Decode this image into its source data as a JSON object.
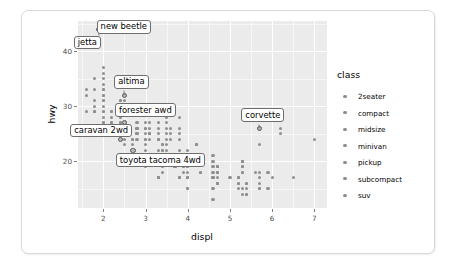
{
  "chart_data": {
    "type": "scatter",
    "title": "",
    "xlabel": "displ",
    "ylabel": "hwy",
    "xlim": [
      1.4,
      7.3
    ],
    "ylim": [
      11.5,
      45.5
    ],
    "xticks": [
      "2",
      "3",
      "4",
      "5",
      "6",
      "7"
    ],
    "xtick_values": [
      2,
      3,
      4,
      5,
      6,
      7
    ],
    "yticks": [
      "20",
      "30",
      "40"
    ],
    "ytick_values": [
      20,
      30,
      40
    ],
    "grid": true,
    "legend": {
      "title": "class",
      "position": "right",
      "entries": [
        {
          "label": "2seater",
          "color": "#8e8e8e"
        },
        {
          "label": "compact",
          "color": "#8e8e8e"
        },
        {
          "label": "midsize",
          "color": "#8e8e8e"
        },
        {
          "label": "minivan",
          "color": "#8e8e8e"
        },
        {
          "label": "pickup",
          "color": "#8e8e8e"
        },
        {
          "label": "subcompact",
          "color": "#8e8e8e"
        },
        {
          "label": "suv",
          "color": "#8e8e8e"
        }
      ]
    },
    "annotations": [
      {
        "text": "new beetle",
        "x": 2.0,
        "y": 44.0,
        "label_x": 2.48,
        "label_y": 44.3
      },
      {
        "text": "jetta",
        "x": 1.9,
        "y": 44.0,
        "label_x": 1.62,
        "label_y": 41.4
      },
      {
        "text": "altima",
        "x": 2.5,
        "y": 32.0,
        "label_x": 2.66,
        "label_y": 34.3
      },
      {
        "text": "forester awd",
        "x": 2.5,
        "y": 27.0,
        "label_x": 3.0,
        "label_y": 29.1
      },
      {
        "text": "caravan 2wd",
        "x": 2.4,
        "y": 24.0,
        "label_x": 1.95,
        "label_y": 25.4
      },
      {
        "text": "toyota tacoma 4wd",
        "x": 2.7,
        "y": 22.0,
        "label_x": 3.35,
        "label_y": 20.0
      },
      {
        "text": "corvette",
        "x": 5.7,
        "y": 26.0,
        "label_x": 5.78,
        "label_y": 28.2
      }
    ],
    "points": [
      {
        "x": 1.8,
        "y": 29
      },
      {
        "x": 1.8,
        "y": 29
      },
      {
        "x": 2.0,
        "y": 31
      },
      {
        "x": 2.0,
        "y": 30
      },
      {
        "x": 2.8,
        "y": 26
      },
      {
        "x": 2.8,
        "y": 26
      },
      {
        "x": 3.1,
        "y": 27
      },
      {
        "x": 1.8,
        "y": 26
      },
      {
        "x": 1.8,
        "y": 25
      },
      {
        "x": 2.0,
        "y": 28
      },
      {
        "x": 2.0,
        "y": 27
      },
      {
        "x": 2.8,
        "y": 25
      },
      {
        "x": 2.8,
        "y": 25
      },
      {
        "x": 3.1,
        "y": 25
      },
      {
        "x": 3.1,
        "y": 25
      },
      {
        "x": 2.8,
        "y": 24
      },
      {
        "x": 3.1,
        "y": 25
      },
      {
        "x": 4.2,
        "y": 23
      },
      {
        "x": 5.3,
        "y": 20
      },
      {
        "x": 5.3,
        "y": 15
      },
      {
        "x": 5.3,
        "y": 20
      },
      {
        "x": 5.7,
        "y": 17
      },
      {
        "x": 6.0,
        "y": 17
      },
      {
        "x": 5.7,
        "y": 26
      },
      {
        "x": 5.7,
        "y": 23
      },
      {
        "x": 6.2,
        "y": 26
      },
      {
        "x": 6.2,
        "y": 25
      },
      {
        "x": 7.0,
        "y": 24
      },
      {
        "x": 5.3,
        "y": 19
      },
      {
        "x": 5.3,
        "y": 14
      },
      {
        "x": 5.7,
        "y": 15
      },
      {
        "x": 6.5,
        "y": 17
      },
      {
        "x": 2.4,
        "y": 27
      },
      {
        "x": 2.4,
        "y": 30
      },
      {
        "x": 3.1,
        "y": 26
      },
      {
        "x": 3.5,
        "y": 29
      },
      {
        "x": 3.6,
        "y": 26
      },
      {
        "x": 2.4,
        "y": 24
      },
      {
        "x": 3.0,
        "y": 24
      },
      {
        "x": 3.3,
        "y": 17
      },
      {
        "x": 3.3,
        "y": 17
      },
      {
        "x": 3.3,
        "y": 17
      },
      {
        "x": 3.3,
        "y": 17
      },
      {
        "x": 3.3,
        "y": 17
      },
      {
        "x": 3.8,
        "y": 17
      },
      {
        "x": 3.8,
        "y": 17
      },
      {
        "x": 3.8,
        "y": 17
      },
      {
        "x": 4.0,
        "y": 17
      },
      {
        "x": 3.7,
        "y": 19
      },
      {
        "x": 3.7,
        "y": 19
      },
      {
        "x": 3.9,
        "y": 19
      },
      {
        "x": 3.9,
        "y": 19
      },
      {
        "x": 4.7,
        "y": 19
      },
      {
        "x": 4.7,
        "y": 19
      },
      {
        "x": 4.7,
        "y": 19
      },
      {
        "x": 5.2,
        "y": 17
      },
      {
        "x": 5.2,
        "y": 17
      },
      {
        "x": 3.9,
        "y": 18
      },
      {
        "x": 4.7,
        "y": 18
      },
      {
        "x": 4.7,
        "y": 18
      },
      {
        "x": 4.7,
        "y": 18
      },
      {
        "x": 5.2,
        "y": 17
      },
      {
        "x": 5.7,
        "y": 18
      },
      {
        "x": 5.9,
        "y": 18
      },
      {
        "x": 4.7,
        "y": 16
      },
      {
        "x": 4.7,
        "y": 16
      },
      {
        "x": 4.7,
        "y": 16
      },
      {
        "x": 5.2,
        "y": 16
      },
      {
        "x": 5.7,
        "y": 16
      },
      {
        "x": 5.9,
        "y": 15
      },
      {
        "x": 4.6,
        "y": 15
      },
      {
        "x": 5.4,
        "y": 14
      },
      {
        "x": 5.4,
        "y": 14
      },
      {
        "x": 4.0,
        "y": 15
      },
      {
        "x": 4.0,
        "y": 15
      },
      {
        "x": 4.6,
        "y": 13
      },
      {
        "x": 5.0,
        "y": 17
      },
      {
        "x": 4.2,
        "y": 23
      },
      {
        "x": 4.2,
        "y": 23
      },
      {
        "x": 4.6,
        "y": 19
      },
      {
        "x": 4.6,
        "y": 18
      },
      {
        "x": 4.6,
        "y": 17
      },
      {
        "x": 4.6,
        "y": 17
      },
      {
        "x": 5.4,
        "y": 16
      },
      {
        "x": 5.4,
        "y": 16
      },
      {
        "x": 5.4,
        "y": 15
      },
      {
        "x": 4.0,
        "y": 19
      },
      {
        "x": 4.0,
        "y": 19
      },
      {
        "x": 4.6,
        "y": 21
      },
      {
        "x": 4.6,
        "y": 20
      },
      {
        "x": 2.4,
        "y": 31
      },
      {
        "x": 2.4,
        "y": 31
      },
      {
        "x": 2.5,
        "y": 31
      },
      {
        "x": 3.3,
        "y": 27
      },
      {
        "x": 2.0,
        "y": 33
      },
      {
        "x": 2.0,
        "y": 35
      },
      {
        "x": 2.0,
        "y": 32
      },
      {
        "x": 2.0,
        "y": 36
      },
      {
        "x": 2.0,
        "y": 37
      },
      {
        "x": 2.0,
        "y": 34
      },
      {
        "x": 1.8,
        "y": 33
      },
      {
        "x": 1.6,
        "y": 33
      },
      {
        "x": 1.6,
        "y": 32
      },
      {
        "x": 1.6,
        "y": 29
      },
      {
        "x": 1.8,
        "y": 29
      },
      {
        "x": 2.0,
        "y": 29
      },
      {
        "x": 2.0,
        "y": 31
      },
      {
        "x": 2.5,
        "y": 29
      },
      {
        "x": 2.5,
        "y": 27
      },
      {
        "x": 2.5,
        "y": 26
      },
      {
        "x": 2.5,
        "y": 26
      },
      {
        "x": 2.5,
        "y": 25
      },
      {
        "x": 2.2,
        "y": 29
      },
      {
        "x": 2.2,
        "y": 29
      },
      {
        "x": 2.2,
        "y": 28
      },
      {
        "x": 2.2,
        "y": 27
      },
      {
        "x": 2.2,
        "y": 26
      },
      {
        "x": 2.4,
        "y": 26
      },
      {
        "x": 2.4,
        "y": 26
      },
      {
        "x": 2.4,
        "y": 25
      },
      {
        "x": 2.4,
        "y": 25
      },
      {
        "x": 2.4,
        "y": 24
      },
      {
        "x": 3.0,
        "y": 26
      },
      {
        "x": 3.0,
        "y": 25
      },
      {
        "x": 3.0,
        "y": 24
      },
      {
        "x": 3.3,
        "y": 26
      },
      {
        "x": 3.3,
        "y": 25
      },
      {
        "x": 3.3,
        "y": 24
      },
      {
        "x": 3.5,
        "y": 26
      },
      {
        "x": 3.5,
        "y": 25
      },
      {
        "x": 3.5,
        "y": 24
      },
      {
        "x": 3.8,
        "y": 26
      },
      {
        "x": 3.8,
        "y": 25
      },
      {
        "x": 3.8,
        "y": 24
      },
      {
        "x": 3.8,
        "y": 28
      },
      {
        "x": 2.7,
        "y": 23
      },
      {
        "x": 2.7,
        "y": 22
      },
      {
        "x": 3.0,
        "y": 22
      },
      {
        "x": 3.4,
        "y": 22
      },
      {
        "x": 3.4,
        "y": 22
      },
      {
        "x": 4.0,
        "y": 20
      },
      {
        "x": 4.0,
        "y": 20
      },
      {
        "x": 4.0,
        "y": 18
      },
      {
        "x": 4.3,
        "y": 18
      },
      {
        "x": 4.3,
        "y": 18
      },
      {
        "x": 3.0,
        "y": 19
      },
      {
        "x": 3.4,
        "y": 19
      },
      {
        "x": 3.4,
        "y": 18
      },
      {
        "x": 4.0,
        "y": 17
      },
      {
        "x": 4.0,
        "y": 17
      },
      {
        "x": 2.7,
        "y": 24
      },
      {
        "x": 2.7,
        "y": 24
      },
      {
        "x": 3.0,
        "y": 23
      },
      {
        "x": 3.4,
        "y": 23
      },
      {
        "x": 3.4,
        "y": 23
      },
      {
        "x": 4.7,
        "y": 17
      },
      {
        "x": 4.7,
        "y": 16
      },
      {
        "x": 5.2,
        "y": 15
      },
      {
        "x": 5.7,
        "y": 15
      },
      {
        "x": 5.2,
        "y": 16
      },
      {
        "x": 2.5,
        "y": 24
      },
      {
        "x": 2.5,
        "y": 23
      },
      {
        "x": 3.5,
        "y": 23
      },
      {
        "x": 3.5,
        "y": 22
      },
      {
        "x": 3.3,
        "y": 22
      },
      {
        "x": 3.3,
        "y": 21
      },
      {
        "x": 2.2,
        "y": 27
      },
      {
        "x": 2.2,
        "y": 26
      },
      {
        "x": 2.4,
        "y": 28
      },
      {
        "x": 2.4,
        "y": 27
      },
      {
        "x": 3.0,
        "y": 27
      },
      {
        "x": 3.0,
        "y": 26
      },
      {
        "x": 3.5,
        "y": 28
      },
      {
        "x": 3.5,
        "y": 27
      },
      {
        "x": 1.8,
        "y": 35
      },
      {
        "x": 1.8,
        "y": 31
      },
      {
        "x": 1.8,
        "y": 30
      },
      {
        "x": 2.0,
        "y": 33
      },
      {
        "x": 2.0,
        "y": 32
      },
      {
        "x": 2.8,
        "y": 27
      },
      {
        "x": 2.8,
        "y": 26
      },
      {
        "x": 3.6,
        "y": 25
      },
      {
        "x": 3.6,
        "y": 24
      },
      {
        "x": 2.0,
        "y": 29
      },
      {
        "x": 2.0,
        "y": 27
      },
      {
        "x": 3.3,
        "y": 24
      },
      {
        "x": 3.3,
        "y": 24
      },
      {
        "x": 4.0,
        "y": 22
      },
      {
        "x": 5.6,
        "y": 18
      },
      {
        "x": 3.1,
        "y": 24
      },
      {
        "x": 3.8,
        "y": 22
      },
      {
        "x": 3.8,
        "y": 21
      },
      {
        "x": 3.8,
        "y": 21
      },
      {
        "x": 5.3,
        "y": 18
      },
      {
        "x": 5.3,
        "y": 18
      },
      {
        "x": 5.3,
        "y": 19
      },
      {
        "x": 5.3,
        "y": 20
      },
      {
        "x": 5.3,
        "y": 20
      }
    ]
  }
}
